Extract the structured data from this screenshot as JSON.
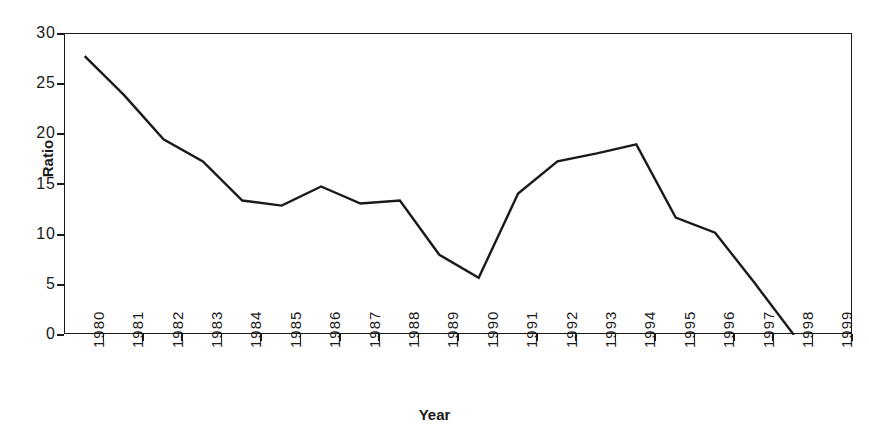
{
  "chart_data": {
    "type": "line",
    "title": "",
    "xlabel": "Year",
    "ylabel": "Ratio",
    "categories": [
      "1980",
      "1981",
      "1982",
      "1983",
      "1984",
      "1985",
      "1986",
      "1987",
      "1988",
      "1989",
      "1990",
      "1991",
      "1992",
      "1993",
      "1994",
      "1995",
      "1996",
      "1997",
      "1998",
      "1999"
    ],
    "values": [
      27.8,
      23.9,
      19.5,
      17.3,
      13.4,
      12.9,
      14.8,
      13.1,
      13.4,
      8.0,
      5.7,
      14.1,
      17.3,
      18.1,
      19.0,
      11.7,
      10.2,
      5.2,
      0.0,
      null
    ],
    "series": [
      {
        "name": "Ratio",
        "values": [
          27.8,
          23.9,
          19.5,
          17.3,
          13.4,
          12.9,
          14.8,
          13.1,
          13.4,
          8.0,
          5.7,
          14.1,
          17.3,
          18.1,
          19.0,
          11.7,
          10.2,
          5.2,
          0.0,
          null
        ]
      }
    ],
    "ylim": [
      0,
      30
    ],
    "yticks": [
      0,
      5,
      10,
      15,
      20,
      25,
      30
    ],
    "ytick_labels": [
      "0",
      "5",
      "10",
      "15",
      "20",
      "25",
      "30"
    ],
    "grid": false,
    "legend": "none",
    "line_color": "#1a1a1a",
    "background_color": "#ffffff",
    "axis_color": "#1a1a1a"
  }
}
